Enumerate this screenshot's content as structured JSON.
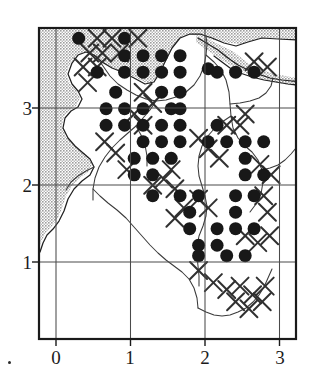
{
  "figure": {
    "type": "distribution-map",
    "corner_marker": "."
  },
  "axes": {
    "x": {
      "ticks": [
        "0",
        "1",
        "2",
        "3"
      ],
      "tick_positions_px": [
        56,
        130.5,
        205,
        279.5
      ],
      "range": [
        -0.25,
        3.25
      ]
    },
    "y": {
      "ticks": [
        "3",
        "2",
        "1"
      ],
      "tick_positions_px": [
        108,
        185,
        262
      ],
      "range": [
        0.0,
        3.6
      ]
    },
    "frame": {
      "left": 38,
      "top": 27,
      "right": 297,
      "bottom": 340
    }
  },
  "colors": {
    "frame": "#1a1a1a",
    "gridline": "#4a4a4a",
    "land_shading": "#c9c9c9",
    "coastline": "#1f1f1f",
    "river": "#3a3a3a",
    "record_dot": "#181818",
    "cross_mark": "#303030",
    "background": "#ffffff",
    "text": "#1b1b1b"
  },
  "symbols": {
    "filled_circle": {
      "name": "record-dot",
      "diameter_px": 13,
      "meaning": "present record"
    },
    "cross": {
      "name": "cross-mark",
      "size_px": 17,
      "meaning": "older / secondary record"
    }
  },
  "chart_data": {
    "type": "scatter",
    "title": "",
    "xlabel": "",
    "ylabel": "",
    "xlim": [
      -0.25,
      3.25
    ],
    "ylim": [
      0.0,
      3.6
    ],
    "grid": true,
    "grid_step": 0.25,
    "legend": "none",
    "series": [
      {
        "name": "record-dot",
        "marker": "filled-circle",
        "points": [
          [
            0.3,
            3.47
          ],
          [
            0.92,
            3.47
          ],
          [
            0.92,
            3.27
          ],
          [
            1.17,
            3.27
          ],
          [
            1.42,
            3.27
          ],
          [
            1.67,
            3.27
          ],
          [
            0.55,
            3.08
          ],
          [
            0.92,
            3.08
          ],
          [
            1.17,
            3.08
          ],
          [
            1.42,
            3.08
          ],
          [
            1.67,
            3.08
          ],
          [
            2.05,
            3.12
          ],
          [
            2.17,
            3.08
          ],
          [
            2.42,
            3.08
          ],
          [
            2.67,
            3.08
          ],
          [
            0.8,
            2.85
          ],
          [
            1.42,
            2.85
          ],
          [
            1.67,
            2.85
          ],
          [
            0.67,
            2.66
          ],
          [
            0.92,
            2.66
          ],
          [
            1.17,
            2.66
          ],
          [
            1.55,
            2.66
          ],
          [
            1.67,
            2.66
          ],
          [
            0.67,
            2.47
          ],
          [
            0.92,
            2.47
          ],
          [
            1.17,
            2.47
          ],
          [
            1.42,
            2.47
          ],
          [
            1.67,
            2.47
          ],
          [
            2.17,
            2.47
          ],
          [
            1.17,
            2.28
          ],
          [
            1.42,
            2.28
          ],
          [
            1.67,
            2.28
          ],
          [
            2.05,
            2.28
          ],
          [
            2.3,
            2.28
          ],
          [
            2.55,
            2.28
          ],
          [
            2.8,
            2.28
          ],
          [
            1.05,
            2.09
          ],
          [
            1.3,
            2.09
          ],
          [
            1.55,
            2.09
          ],
          [
            2.55,
            2.09
          ],
          [
            1.05,
            1.9
          ],
          [
            1.3,
            1.9
          ],
          [
            2.55,
            1.9
          ],
          [
            2.8,
            1.9
          ],
          [
            1.3,
            1.66
          ],
          [
            1.67,
            1.66
          ],
          [
            1.92,
            1.66
          ],
          [
            2.42,
            1.66
          ],
          [
            2.67,
            1.66
          ],
          [
            1.8,
            1.47
          ],
          [
            2.42,
            1.47
          ],
          [
            1.8,
            1.28
          ],
          [
            2.17,
            1.28
          ],
          [
            2.42,
            1.28
          ],
          [
            2.67,
            1.28
          ],
          [
            1.92,
            1.09
          ],
          [
            2.17,
            1.09
          ],
          [
            1.92,
            0.97
          ],
          [
            2.3,
            0.97
          ],
          [
            2.55,
            0.97
          ]
        ]
      },
      {
        "name": "cross-mark",
        "marker": "x",
        "points": [
          [
            0.55,
            3.47
          ],
          [
            0.75,
            3.47
          ],
          [
            1.1,
            3.47
          ],
          [
            0.45,
            3.3
          ],
          [
            0.62,
            3.3
          ],
          [
            0.85,
            3.3
          ],
          [
            0.36,
            3.14
          ],
          [
            0.55,
            3.14
          ],
          [
            2.67,
            3.2
          ],
          [
            2.85,
            3.14
          ],
          [
            0.42,
            2.96
          ],
          [
            2.55,
            2.6
          ],
          [
            1.17,
            2.85
          ],
          [
            1.3,
            2.72
          ],
          [
            1.05,
            2.6
          ],
          [
            1.17,
            2.47
          ],
          [
            2.3,
            2.47
          ],
          [
            2.48,
            2.47
          ],
          [
            0.65,
            2.28
          ],
          [
            0.8,
            2.15
          ],
          [
            1.92,
            2.32
          ],
          [
            2.05,
            2.2
          ],
          [
            2.2,
            2.09
          ],
          [
            0.95,
            1.96
          ],
          [
            1.55,
            1.96
          ],
          [
            1.45,
            1.85
          ],
          [
            1.3,
            1.78
          ],
          [
            1.6,
            1.74
          ],
          [
            1.92,
            1.62
          ],
          [
            2.75,
            2.02
          ],
          [
            2.9,
            1.9
          ],
          [
            1.72,
            1.52
          ],
          [
            2.05,
            1.52
          ],
          [
            2.8,
            1.66
          ],
          [
            1.6,
            1.4
          ],
          [
            2.85,
            1.47
          ],
          [
            2.55,
            1.2
          ],
          [
            2.72,
            1.12
          ],
          [
            2.88,
            1.2
          ],
          [
            1.92,
            0.8
          ],
          [
            2.12,
            0.66
          ],
          [
            2.3,
            0.58
          ],
          [
            2.48,
            0.62
          ],
          [
            2.65,
            0.52
          ],
          [
            2.82,
            0.62
          ],
          [
            2.42,
            0.44
          ],
          [
            2.6,
            0.36
          ],
          [
            2.78,
            0.44
          ]
        ]
      }
    ]
  }
}
